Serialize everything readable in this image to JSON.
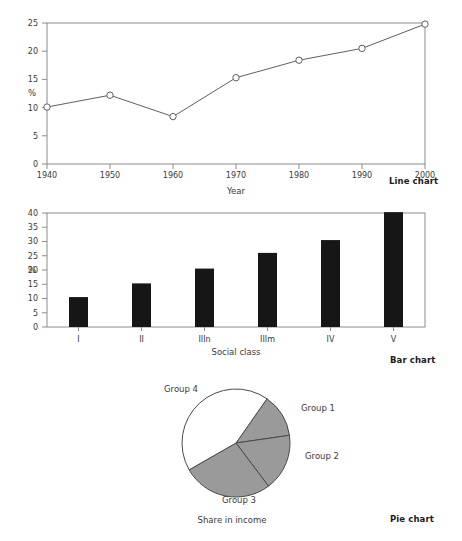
{
  "page": {
    "top_cut_text": "",
    "captions": {
      "line": "Line chart",
      "bar": "Bar chart",
      "pie": "Pie chart"
    }
  },
  "chart_data": [
    {
      "type": "line",
      "title": "",
      "xlabel": "Year",
      "ylabel": "%",
      "x": [
        1940,
        1950,
        1960,
        1970,
        1980,
        1990,
        2000
      ],
      "values": [
        10.1,
        12.2,
        8.4,
        15.3,
        18.4,
        20.5,
        24.8
      ],
      "xticklabels": [
        "1940",
        "1950",
        "1960",
        "1970",
        "1980",
        "1990",
        "2000"
      ],
      "yticklabels": [
        "0",
        "5",
        "10",
        "15",
        "20",
        "25"
      ],
      "yticks": [
        0,
        5,
        10,
        15,
        20,
        25
      ],
      "xlim": [
        1940,
        2000
      ],
      "ylim": [
        0,
        25
      ],
      "grid": false,
      "legend": "none",
      "marker": "open-circle",
      "line_color": "#5f5f5f",
      "marker_fill": "#ffffff"
    },
    {
      "type": "bar",
      "title": "",
      "xlabel": "Social class",
      "ylabel": "%",
      "categories": [
        "I",
        "II",
        "IIIn",
        "IIIm",
        "IV",
        "V"
      ],
      "values": [
        10.5,
        15.3,
        20.5,
        26.0,
        30.5,
        40.3
      ],
      "yticklabels": [
        "0",
        "5",
        "10",
        "15",
        "20",
        "25",
        "30",
        "35",
        "40"
      ],
      "yticks": [
        0,
        5,
        10,
        15,
        20,
        25,
        30,
        35,
        40
      ],
      "ylim": [
        0,
        40
      ],
      "grid": false,
      "legend": "none",
      "bar_color": "#161616"
    },
    {
      "type": "pie",
      "title": "Share in income",
      "labels": [
        "Group 1",
        "Group 2",
        "Group 3",
        "Group 4"
      ],
      "values": [
        13,
        17,
        27,
        43
      ],
      "start_angle_deg": 35,
      "colors": [
        "#9a9a9a",
        "#9a9a9a",
        "#9a9a9a",
        "#ffffff"
      ],
      "edge_color": "#4a4a4a",
      "legend": "labels-outside"
    }
  ]
}
